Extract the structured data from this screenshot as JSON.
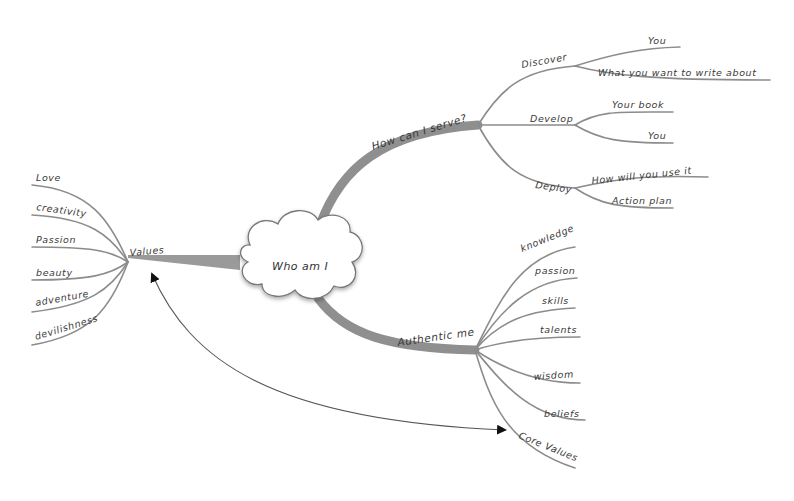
{
  "diagram": {
    "type": "mind-map",
    "center": {
      "label": "Who am I"
    },
    "branches": [
      {
        "label": "How can I serve?",
        "children": [
          {
            "label": "Discover",
            "children": [
              {
                "label": "You"
              },
              {
                "label": "What you want to write about"
              }
            ]
          },
          {
            "label": "Develop",
            "children": [
              {
                "label": "Your book"
              },
              {
                "label": "You"
              }
            ]
          },
          {
            "label": "Deploy",
            "children": [
              {
                "label": "How will you use it"
              },
              {
                "label": "Action plan"
              }
            ]
          }
        ]
      },
      {
        "label": "Values",
        "children": [
          {
            "label": "Love"
          },
          {
            "label": "creativity"
          },
          {
            "label": "Passion"
          },
          {
            "label": "beauty"
          },
          {
            "label": "adventure"
          },
          {
            "label": "devilishness"
          }
        ]
      },
      {
        "label": "Authentic me",
        "children": [
          {
            "label": "knowledge"
          },
          {
            "label": "passion"
          },
          {
            "label": "skills"
          },
          {
            "label": "talents"
          },
          {
            "label": "wisdom"
          },
          {
            "label": "beliefs"
          },
          {
            "label": "Core Values"
          }
        ]
      }
    ],
    "relationships": [
      {
        "from": "Values",
        "to": "Core Values",
        "style": "double-arrow"
      }
    ]
  }
}
